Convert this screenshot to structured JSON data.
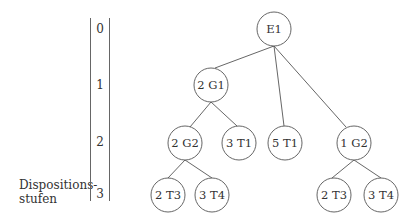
{
  "axis": {
    "title_line1": "Dispositions-",
    "title_line2": "stufen",
    "levels": [
      "0",
      "1",
      "2",
      "3"
    ]
  },
  "tree": {
    "nodes": [
      {
        "id": "e1",
        "label": "E1",
        "level": 0
      },
      {
        "id": "g1",
        "label": "2 G1",
        "level": 1
      },
      {
        "id": "g2a",
        "label": "2 G2",
        "level": 2
      },
      {
        "id": "t1a",
        "label": "3 T1",
        "level": 2
      },
      {
        "id": "t1b",
        "label": "5 T1",
        "level": 2
      },
      {
        "id": "g2b",
        "label": "1 G2",
        "level": 2
      },
      {
        "id": "t3a",
        "label": "2 T3",
        "level": 3
      },
      {
        "id": "t4a",
        "label": "3 T4",
        "level": 3
      },
      {
        "id": "t3b",
        "label": "2 T3",
        "level": 3
      },
      {
        "id": "t4b",
        "label": "3 T4",
        "level": 3
      }
    ],
    "edges": [
      [
        "E1",
        "2 G1"
      ],
      [
        "E1",
        "5 T1"
      ],
      [
        "E1",
        "1 G2"
      ],
      [
        "2 G1",
        "2 G2"
      ],
      [
        "2 G1",
        "3 T1"
      ],
      [
        "2 G2",
        "2 T3"
      ],
      [
        "2 G2",
        "3 T4"
      ],
      [
        "1 G2",
        "2 T3"
      ],
      [
        "1 G2",
        "3 T4"
      ]
    ]
  }
}
